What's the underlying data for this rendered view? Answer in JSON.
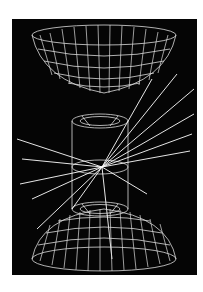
{
  "image": {
    "subject": "particle detector event display",
    "background_color": "#050505",
    "line_color": "#e6e6e6",
    "elements": [
      "upper-calorimeter-endcap",
      "central-cylinder-detector",
      "particle-tracks",
      "lower-calorimeter-endcap"
    ]
  }
}
